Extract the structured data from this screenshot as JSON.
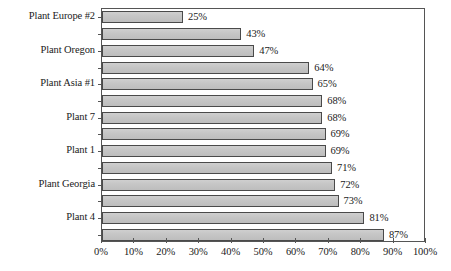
{
  "chart_data": {
    "type": "bar",
    "orientation": "horizontal",
    "title": "",
    "subtitle": "",
    "xlabel": "",
    "ylabel": "",
    "xlim": [
      0,
      100
    ],
    "xticks": [
      0,
      10,
      20,
      30,
      40,
      50,
      60,
      70,
      80,
      90,
      100
    ],
    "xtick_labels": [
      "0%",
      "10%",
      "20%",
      "30%",
      "40%",
      "50%",
      "60%",
      "70%",
      "80%",
      "90%",
      "100%"
    ],
    "grid": false,
    "legend": null,
    "value_label_suffix": "%",
    "categories": [
      "Plant Europe #2",
      "",
      "Plant Oregon",
      "",
      "Plant Asia #1",
      "",
      "Plant 7",
      "",
      "Plant 1",
      "",
      "Plant Georgia",
      "",
      "Plant 4",
      ""
    ],
    "visible_category_labels": [
      "Plant Europe #2",
      "Plant Oregon",
      "Plant Asia #1",
      "Plant 7",
      "Plant 1",
      "Plant Georgia",
      "Plant 4"
    ],
    "values": [
      25,
      43,
      47,
      64,
      65,
      68,
      68,
      69,
      69,
      71,
      72,
      73,
      81,
      87
    ],
    "value_labels": [
      "25%",
      "43%",
      "47%",
      "64%",
      "65%",
      "68%",
      "68%",
      "69%",
      "69%",
      "71%",
      "72%",
      "73%",
      "81%",
      "87%"
    ],
    "bars": [
      {
        "label": "Plant Europe #2",
        "value": 25,
        "value_label": "25%",
        "labeled": true
      },
      {
        "label": "",
        "value": 43,
        "value_label": "43%",
        "labeled": false
      },
      {
        "label": "Plant Oregon",
        "value": 47,
        "value_label": "47%",
        "labeled": true
      },
      {
        "label": "",
        "value": 64,
        "value_label": "64%",
        "labeled": false
      },
      {
        "label": "Plant Asia #1",
        "value": 65,
        "value_label": "65%",
        "labeled": true
      },
      {
        "label": "",
        "value": 68,
        "value_label": "68%",
        "labeled": false
      },
      {
        "label": "Plant 7",
        "value": 68,
        "value_label": "68%",
        "labeled": true
      },
      {
        "label": "",
        "value": 69,
        "value_label": "69%",
        "labeled": false
      },
      {
        "label": "Plant 1",
        "value": 69,
        "value_label": "69%",
        "labeled": true
      },
      {
        "label": "",
        "value": 71,
        "value_label": "71%",
        "labeled": false
      },
      {
        "label": "Plant Georgia",
        "value": 72,
        "value_label": "72%",
        "labeled": true
      },
      {
        "label": "",
        "value": 73,
        "value_label": "73%",
        "labeled": false
      },
      {
        "label": "Plant 4",
        "value": 81,
        "value_label": "81%",
        "labeled": true
      },
      {
        "label": "",
        "value": 87,
        "value_label": "87%",
        "labeled": false
      }
    ],
    "colors": {
      "bar_fill": "#c4c4c4",
      "bar_border": "#4a4a4a",
      "frame": "#555555",
      "text": "#1a1a1a",
      "background": "#ffffff"
    }
  }
}
